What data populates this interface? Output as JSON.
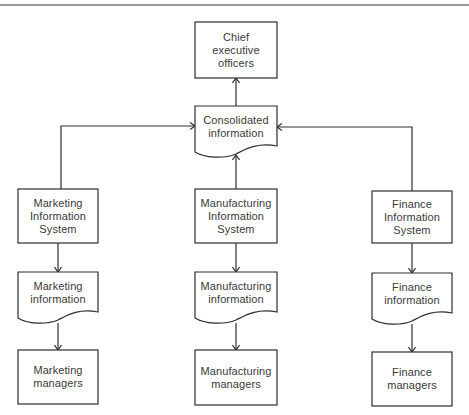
{
  "diagram": {
    "type": "flowchart",
    "stroke_color": "#2e2e2e",
    "text_color": "#3a3a3a",
    "top_rule_color": "#9a9a9a",
    "nodes": [
      {
        "id": "ceo",
        "shape": "process",
        "lines": [
          "Chief",
          "executive",
          "officers"
        ],
        "x": 195,
        "y": 22,
        "w": 82,
        "h": 56
      },
      {
        "id": "consolidated",
        "shape": "document",
        "lines": [
          "Consolidated",
          "information"
        ],
        "x": 195,
        "y": 106,
        "w": 82,
        "h": 46
      },
      {
        "id": "mkt_is",
        "shape": "process",
        "lines": [
          "Marketing",
          "Information",
          "System"
        ],
        "x": 18,
        "y": 189,
        "w": 80,
        "h": 54
      },
      {
        "id": "mfg_is",
        "shape": "process",
        "lines": [
          "Manufacturing",
          "Information",
          "System"
        ],
        "x": 195,
        "y": 189,
        "w": 82,
        "h": 54
      },
      {
        "id": "fin_is",
        "shape": "process",
        "lines": [
          "Finance",
          "Information",
          "System"
        ],
        "x": 372,
        "y": 191,
        "w": 80,
        "h": 52
      },
      {
        "id": "mkt_info",
        "shape": "document",
        "lines": [
          "Marketing",
          "information"
        ],
        "x": 18,
        "y": 272,
        "w": 80,
        "h": 46
      },
      {
        "id": "mfg_info",
        "shape": "document",
        "lines": [
          "Manufacturing",
          "information"
        ],
        "x": 195,
        "y": 272,
        "w": 82,
        "h": 46
      },
      {
        "id": "fin_info",
        "shape": "document",
        "lines": [
          "Finance",
          "information"
        ],
        "x": 372,
        "y": 273,
        "w": 80,
        "h": 46
      },
      {
        "id": "mkt_mgr",
        "shape": "process",
        "lines": [
          "Marketing",
          "managers"
        ],
        "x": 18,
        "y": 350,
        "w": 80,
        "h": 54
      },
      {
        "id": "mfg_mgr",
        "shape": "process",
        "lines": [
          "Manufacturing",
          "managers"
        ],
        "x": 195,
        "y": 350,
        "w": 82,
        "h": 55
      },
      {
        "id": "fin_mgr",
        "shape": "process",
        "lines": [
          "Finance",
          "managers"
        ],
        "x": 372,
        "y": 352,
        "w": 80,
        "h": 54
      }
    ],
    "edges": [
      {
        "from": "consolidated",
        "to": "ceo",
        "points": [
          [
            236,
            106
          ],
          [
            236,
            78
          ]
        ]
      },
      {
        "from": "mkt_is",
        "to": "consolidated",
        "points": [
          [
            61,
            189
          ],
          [
            61,
            126
          ],
          [
            195,
            126
          ]
        ]
      },
      {
        "from": "fin_is",
        "to": "consolidated",
        "points": [
          [
            412,
            191
          ],
          [
            412,
            127
          ],
          [
            277,
            127
          ]
        ]
      },
      {
        "from": "mfg_is",
        "to": "consolidated",
        "points": [
          [
            236,
            189
          ],
          [
            236,
            155
          ]
        ]
      },
      {
        "from": "mkt_is",
        "to": "mkt_info",
        "points": [
          [
            58,
            243
          ],
          [
            58,
            272
          ]
        ]
      },
      {
        "from": "mkt_info",
        "to": "mkt_mgr",
        "points": [
          [
            58,
            323
          ],
          [
            58,
            350
          ]
        ]
      },
      {
        "from": "mfg_is",
        "to": "mfg_info",
        "points": [
          [
            236,
            243
          ],
          [
            236,
            272
          ]
        ]
      },
      {
        "from": "mfg_info",
        "to": "mfg_mgr",
        "points": [
          [
            236,
            323
          ],
          [
            236,
            350
          ]
        ]
      },
      {
        "from": "fin_is",
        "to": "fin_info",
        "points": [
          [
            412,
            243
          ],
          [
            412,
            273
          ]
        ]
      },
      {
        "from": "fin_info",
        "to": "fin_mgr",
        "points": [
          [
            412,
            324
          ],
          [
            412,
            352
          ]
        ]
      }
    ]
  }
}
